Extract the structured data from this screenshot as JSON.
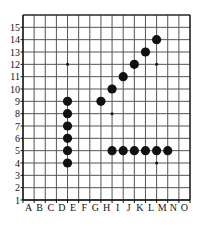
{
  "chart_data": {
    "type": "scatter",
    "title": "",
    "xlabel": "",
    "ylabel": "",
    "grid": true,
    "legend": false,
    "x_tick_labels": [
      "A",
      "B",
      "C",
      "D",
      "E",
      "F",
      "G",
      "H",
      "I",
      "J",
      "K",
      "L",
      "M",
      "N",
      "O"
    ],
    "y_tick_labels": [
      "1",
      "2",
      "3",
      "4",
      "5",
      "6",
      "7",
      "8",
      "9",
      "10",
      "11",
      "12",
      "13",
      "14",
      "15"
    ],
    "xlim": [
      0,
      15
    ],
    "ylim": [
      1,
      15
    ],
    "marker_color": "#111111",
    "grid_color": "#555555",
    "background_color": "#ffffff",
    "series": [
      {
        "name": "large-points",
        "marker_size": "large",
        "points": [
          {
            "x": "D",
            "y": 4
          },
          {
            "x": "D",
            "y": 5
          },
          {
            "x": "D",
            "y": 6
          },
          {
            "x": "D",
            "y": 7
          },
          {
            "x": "D",
            "y": 8
          },
          {
            "x": "D",
            "y": 9
          },
          {
            "x": "G",
            "y": 9
          },
          {
            "x": "H",
            "y": 10
          },
          {
            "x": "I",
            "y": 11
          },
          {
            "x": "J",
            "y": 12
          },
          {
            "x": "K",
            "y": 13
          },
          {
            "x": "L",
            "y": 14
          },
          {
            "x": "H",
            "y": 5
          },
          {
            "x": "I",
            "y": 5
          },
          {
            "x": "J",
            "y": 5
          },
          {
            "x": "K",
            "y": 5
          },
          {
            "x": "L",
            "y": 5
          },
          {
            "x": "M",
            "y": 5
          }
        ]
      },
      {
        "name": "small-points",
        "marker_size": "small",
        "points": [
          {
            "x": "D",
            "y": 12
          },
          {
            "x": "H",
            "y": 8
          },
          {
            "x": "L",
            "y": 12
          },
          {
            "x": "L",
            "y": 4
          }
        ]
      }
    ]
  },
  "axes": {
    "x_axis_name": "x-axis-letters",
    "y_axis_name": "y-axis-numbers"
  }
}
